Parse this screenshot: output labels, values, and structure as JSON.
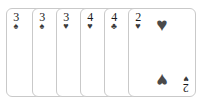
{
  "scene": {
    "name": "playing-card-hand",
    "background_color": "#ffffff",
    "card_face_color": "#ffffff",
    "card_border_color": "#c9c9c9",
    "rank_color": "#1a1a1a",
    "pip_color": "#4a4a4a"
  },
  "suit_glyphs": {
    "spades": "♠",
    "hearts": "♥",
    "clubs": "♣",
    "diamonds": "♦"
  },
  "cards": [
    {
      "rank": "3",
      "suit": "spades",
      "suit_symbol": "♠",
      "label": "3 of spades",
      "left": 6,
      "pip_count": 0,
      "show_pips": false,
      "show_bottom_index": false
    },
    {
      "rank": "3",
      "suit": "spades",
      "suit_symbol": "♠",
      "label": "3 of spades",
      "left": 32,
      "pip_count": 0,
      "show_pips": false,
      "show_bottom_index": false
    },
    {
      "rank": "3",
      "suit": "hearts",
      "suit_symbol": "♥",
      "label": "3 of hearts",
      "left": 56,
      "pip_count": 0,
      "show_pips": false,
      "show_bottom_index": false
    },
    {
      "rank": "4",
      "suit": "hearts",
      "suit_symbol": "♥",
      "label": "4 of hearts",
      "left": 80,
      "pip_count": 2,
      "show_pips": true,
      "show_bottom_index": false
    },
    {
      "rank": "4",
      "suit": "clubs",
      "suit_symbol": "♣",
      "label": "4 of clubs",
      "left": 104,
      "pip_count": 2,
      "show_pips": true,
      "show_bottom_index": false
    },
    {
      "rank": "2",
      "suit": "hearts",
      "suit_symbol": "♥",
      "label": "2 of hearts",
      "left": 128,
      "pip_count": 2,
      "show_pips": true,
      "show_bottom_index": true
    }
  ]
}
